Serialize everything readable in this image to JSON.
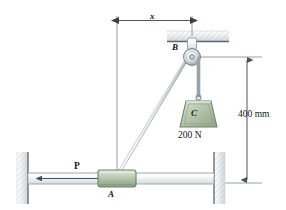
{
  "figure": {
    "labels": {
      "dimension_x": "x",
      "pulley_point": "B",
      "weight_block": "C",
      "weight_value": "200 N",
      "vertical_dimension": "400 mm",
      "applied_force": "P",
      "collar_point": "A"
    },
    "colors": {
      "block_fill": "#aebfa6",
      "block_stroke": "#6e8168",
      "metal_light": "#f2f4f5",
      "metal_stroke": "#8c9196",
      "wall_fill": "#e9edf0",
      "line": "#3c4248",
      "text": "#15161a"
    },
    "geometry": {
      "dimension_x_px": 130,
      "dimension_400mm_px": 126,
      "pulley_center": [
        192,
        57
      ],
      "collar_center": [
        117,
        179
      ]
    }
  }
}
